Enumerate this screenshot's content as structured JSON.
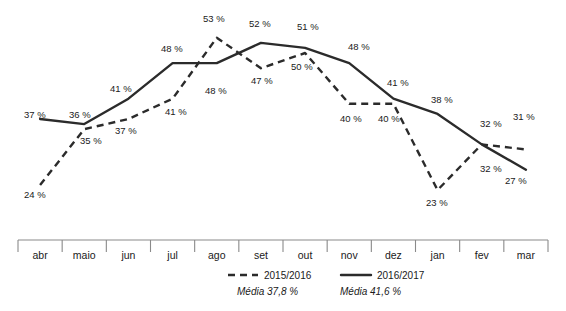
{
  "chart_data": {
    "type": "line",
    "title": "",
    "subtitle": "",
    "xlabel": "",
    "ylabel": "",
    "grid": false,
    "legend_position": "bottom",
    "axis_visible": "x-only",
    "ylim": [
      20,
      56
    ],
    "categories": [
      "abr",
      "maio",
      "jun",
      "jul",
      "ago",
      "set",
      "out",
      "nov",
      "dez",
      "jan",
      "fev",
      "mar"
    ],
    "series": [
      {
        "name": "2015/2016",
        "style": "dashed",
        "color": "#2b2b2b",
        "average_label": "Média 37,8 %",
        "average_value": 37.8,
        "values": [
          24,
          35,
          37,
          41,
          53,
          47,
          50,
          40,
          40,
          23,
          32,
          31
        ],
        "point_labels": [
          "24 %",
          "35 %",
          "37 %",
          "41 %",
          "53 %",
          "47 %",
          "50 %",
          "40 %",
          "40 %",
          "23 %",
          "32 %",
          "31 %"
        ]
      },
      {
        "name": "2016/2017",
        "style": "solid",
        "color": "#2b2b2b",
        "average_label": "Média 41,6 %",
        "average_value": 41.6,
        "values": [
          37,
          36,
          41,
          48,
          48,
          52,
          51,
          48,
          41,
          38,
          32,
          27
        ],
        "point_labels": [
          "37 %",
          "36 %",
          "41 %",
          "48 %",
          "48 %",
          "52 %",
          "51 %",
          "48 %",
          "41 %",
          "38 %",
          "32 %",
          "27 %"
        ]
      }
    ],
    "annotations": [
      {
        "text": "37 %",
        "x": 24,
        "y": 118,
        "anchor": "start"
      },
      {
        "text": "36 %",
        "x": 69,
        "y": 118,
        "anchor": "start"
      },
      {
        "text": "41 %",
        "x": 110,
        "y": 92,
        "anchor": "start"
      },
      {
        "text": "48 %",
        "x": 161,
        "y": 52,
        "anchor": "start"
      },
      {
        "text": "52 %",
        "x": 249,
        "y": 27,
        "anchor": "start"
      },
      {
        "text": "51 %",
        "x": 297,
        "y": 30,
        "anchor": "start"
      },
      {
        "text": "48 %",
        "x": 348,
        "y": 50,
        "anchor": "start"
      },
      {
        "text": "41 %",
        "x": 387,
        "y": 86,
        "anchor": "start"
      },
      {
        "text": "38 %",
        "x": 431,
        "y": 103,
        "anchor": "start"
      },
      {
        "text": "32 %",
        "x": 480,
        "y": 127,
        "anchor": "start"
      },
      {
        "text": "27 %",
        "x": 505,
        "y": 184,
        "anchor": "start"
      },
      {
        "text": "24 %",
        "x": 24,
        "y": 198,
        "anchor": "start"
      },
      {
        "text": "35 %",
        "x": 80,
        "y": 144,
        "anchor": "start"
      },
      {
        "text": "37 %",
        "x": 115,
        "y": 134,
        "anchor": "start"
      },
      {
        "text": "41 %",
        "x": 165,
        "y": 115,
        "anchor": "start"
      },
      {
        "text": "53 %",
        "x": 203,
        "y": 22,
        "anchor": "start"
      },
      {
        "text": "47 %",
        "x": 251,
        "y": 84,
        "anchor": "start"
      },
      {
        "text": "48 %",
        "x": 205,
        "y": 94,
        "anchor": "start"
      },
      {
        "text": "50 %",
        "x": 291,
        "y": 70,
        "anchor": "start"
      },
      {
        "text": "40 %",
        "x": 340,
        "y": 122,
        "anchor": "start"
      },
      {
        "text": "40 %",
        "x": 378,
        "y": 122,
        "anchor": "start"
      },
      {
        "text": "23 %",
        "x": 426,
        "y": 206,
        "anchor": "start"
      },
      {
        "text": "32 %",
        "x": 480,
        "y": 172,
        "anchor": "start"
      },
      {
        "text": "31 %",
        "x": 513,
        "y": 120,
        "anchor": "start"
      }
    ]
  },
  "axis": {
    "months": [
      "abr",
      "maio",
      "jun",
      "jul",
      "ago",
      "set",
      "out",
      "nov",
      "dez",
      "jan",
      "fev",
      "mar"
    ]
  },
  "legend": {
    "entries": [
      {
        "name": "2015/2016",
        "average": "Média 37,8 %"
      },
      {
        "name": "2016/2017",
        "average": "Média 41,6 %"
      }
    ]
  }
}
